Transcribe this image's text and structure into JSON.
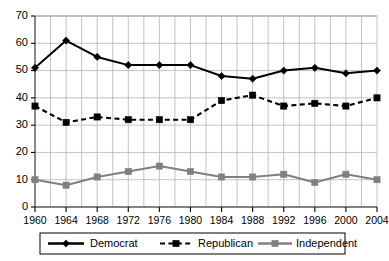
{
  "chart_data": {
    "type": "line",
    "title": "",
    "subtitle": "",
    "xlabel": "",
    "ylabel": "",
    "x": [
      1960,
      1964,
      1968,
      1972,
      1976,
      1980,
      1984,
      1988,
      1992,
      1996,
      2000,
      2004
    ],
    "categories": [
      "1960",
      "1964",
      "1968",
      "1972",
      "1976",
      "1980",
      "1984",
      "1988",
      "1992",
      "1996",
      "2000",
      "2004"
    ],
    "xlim": [
      1960,
      2004
    ],
    "ylim": [
      0,
      70
    ],
    "ytick_labels": [
      "0",
      "10",
      "20",
      "30",
      "40",
      "50",
      "60",
      "70"
    ],
    "ytick_values": [
      0,
      10,
      20,
      30,
      40,
      50,
      60,
      70
    ],
    "xtick_labels": [
      "1960",
      "1964",
      "1968",
      "1972",
      "1976",
      "1980",
      "1984",
      "1988",
      "1992",
      "1996",
      "2000",
      "2004"
    ],
    "grid": true,
    "grid_minor_x_step": 2,
    "legend_position": "bottom",
    "series": [
      {
        "name": "Democrat",
        "color": "#000000",
        "line_style": "solid",
        "marker": "diamond",
        "values": [
          51,
          61,
          55,
          52,
          52,
          52,
          48,
          47,
          50,
          51,
          49,
          50
        ]
      },
      {
        "name": "Republican",
        "color": "#000000",
        "line_style": "dashed",
        "marker": "square",
        "values": [
          37,
          31,
          33,
          32,
          32,
          32,
          39,
          41,
          37,
          38,
          37,
          40
        ]
      },
      {
        "name": "Independent",
        "color": "#808080",
        "line_style": "solid",
        "marker": "square",
        "values": [
          10,
          8,
          11,
          13,
          15,
          13,
          11,
          11,
          12,
          9,
          12,
          10
        ]
      }
    ]
  },
  "legend": {
    "entries": [
      {
        "label": "Democrat"
      },
      {
        "label": "Republican"
      },
      {
        "label": "Independent"
      }
    ]
  }
}
